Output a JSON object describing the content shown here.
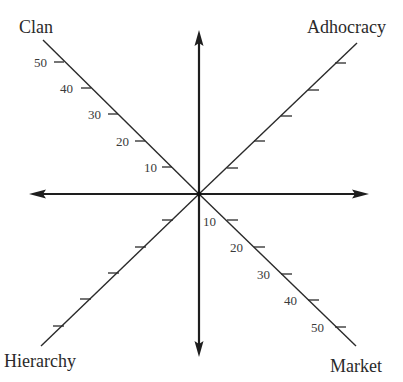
{
  "diagram": {
    "type": "competing-values-framework-axes",
    "center": [
      199,
      194
    ],
    "colors": {
      "ink": "#1e1e1e",
      "label": "#2a2a2a",
      "background": "#ffffff"
    },
    "main_axes": {
      "vertical": {
        "from": [
          199,
          30
        ],
        "to": [
          199,
          357
        ],
        "arrows": [
          "up",
          "down"
        ]
      },
      "horizontal": {
        "from": [
          29,
          194
        ],
        "to": [
          369,
          194
        ],
        "arrows": [
          "left",
          "right"
        ]
      }
    },
    "quadrant_axes": [
      {
        "id": "clan",
        "label": "Clan",
        "end": [
          43,
          40
        ],
        "ticks": [
          10,
          20,
          30,
          40,
          50
        ],
        "tick_labels_visible": true,
        "label_pos": [
          19,
          33
        ]
      },
      {
        "id": "adhocracy",
        "label": "Adhocracy",
        "end": [
          357,
          43
        ],
        "ticks": [
          10,
          20,
          30,
          40,
          50
        ],
        "tick_labels_visible": false,
        "label_pos": [
          307,
          33
        ]
      },
      {
        "id": "hierarchy",
        "label": "Hierarchy",
        "end": [
          41,
          346
        ],
        "ticks": [
          10,
          20,
          30,
          40,
          50
        ],
        "tick_labels_visible": false,
        "label_pos": [
          4,
          367
        ]
      },
      {
        "id": "market",
        "label": "Market",
        "end": [
          356,
          346
        ],
        "ticks": [
          10,
          20,
          30,
          40,
          50
        ],
        "tick_labels_visible": true,
        "label_pos": [
          330,
          372
        ]
      }
    ],
    "scale": {
      "units_per_tick": 10,
      "max": 50,
      "pixels_per_tick": 26.6
    }
  },
  "labels": {
    "clan": "Clan",
    "adhocracy": "Adhocracy",
    "hierarchy": "Hierarchy",
    "market": "Market"
  },
  "tick_labels": {
    "clan": [
      "10",
      "20",
      "30",
      "40",
      "50"
    ],
    "market": [
      "10",
      "20",
      "30",
      "40",
      "50"
    ]
  }
}
